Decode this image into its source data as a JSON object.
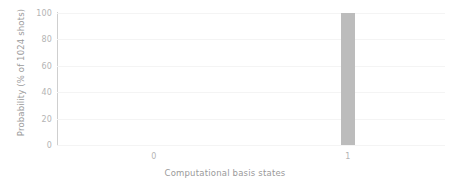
{
  "chart_data": {
    "type": "bar",
    "title": "",
    "subtitle": "",
    "xlabel": "Computational basis states",
    "ylabel": "Probability (% of 1024 shots)",
    "categories": [
      "0",
      "1"
    ],
    "values": [
      0,
      100
    ],
    "series": [
      {
        "name": "Probability",
        "values": [
          0,
          100
        ]
      }
    ],
    "ylim": [
      0,
      100
    ],
    "yticks": [
      0,
      20,
      40,
      60,
      80,
      100
    ],
    "ytick_labels": [
      "0",
      "20",
      "40",
      "60",
      "80",
      "100"
    ],
    "xtick_labels": [
      "0",
      "1"
    ],
    "grid": true,
    "grid_axis": "y",
    "legend": false,
    "legend_position": "none",
    "bar_color": "#bcbcbc",
    "axis_color": "#c9c9c9",
    "grid_color": "#f4f4f4",
    "tick_label_color": "#b4b4b4",
    "axis_label_color": "#9a9a9a",
    "background_color": "#ffffff",
    "annotations": []
  }
}
